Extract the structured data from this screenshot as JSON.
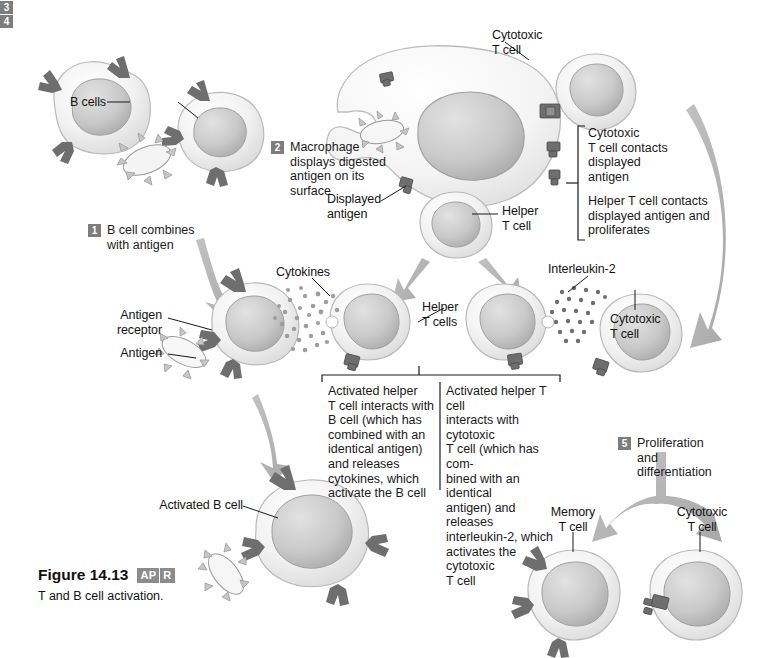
{
  "figure": {
    "title": "Figure 14.13",
    "badge_left": "AP",
    "badge_right": "R",
    "subtitle": "T and B cell activation."
  },
  "steps": [
    {
      "num": "1",
      "text": "B cell combines\nwith antigen"
    },
    {
      "num": "2",
      "text": "Macrophage\ndisplays digested\nantigen on its\nsurface"
    },
    {
      "num": "3",
      "text": ""
    },
    {
      "num": "4",
      "text": ""
    },
    {
      "num": "5",
      "text": "Proliferation\nand\ndifferentiation"
    }
  ],
  "step3": {
    "part_a": "Cytotoxic\nT cell contacts\ndisplayed\nantigen",
    "part_b": "Helper T cell contacts\ndisplayed antigen and\nproliferates"
  },
  "step4": {
    "left": "Activated helper\nT cell interacts with\nB cell (which has\ncombined with an\nidentical  antigen)\nand releases\ncytokines, which\nactivate the B cell",
    "right": "Activated helper  T cell\ninteracts with cytotoxic\nT cell (which has com-\nbined with an identical\nantigen) and releases\ninterleukin-2, which\nactivates the cytotoxic\nT cell"
  },
  "labels": {
    "b_cells": "B cells",
    "cytotoxic_t_cell_top": "Cytotoxic\nT cell",
    "displayed_antigen": "Displayed\nantigen",
    "helper_t_cell": "Helper\nT cell",
    "antigen_receptor": "Antigen\nreceptor",
    "antigen": "Antigen",
    "cytokines": "Cytokines",
    "helper_t_cells": "Helper\nT cells",
    "interleukin_2": "Interleukin-2",
    "cytotoxic_t_cell_mid": "Cytotoxic\nT cell",
    "activated_b_cell": "Activated B cell",
    "memory_t_cell": "Memory\nT cell",
    "cytotoxic_t_cell_bottom": "Cytotoxic\nT cell"
  },
  "colors": {
    "cell_cytoplasm": "#efefef",
    "cell_nucleus": "#c9c9c9",
    "receptor": "#6e6e6e",
    "arrow": "#b3b3b3",
    "antigen_body": "#f4f4f4",
    "step_marker": "#7d7d7d",
    "text": "#141414"
  }
}
